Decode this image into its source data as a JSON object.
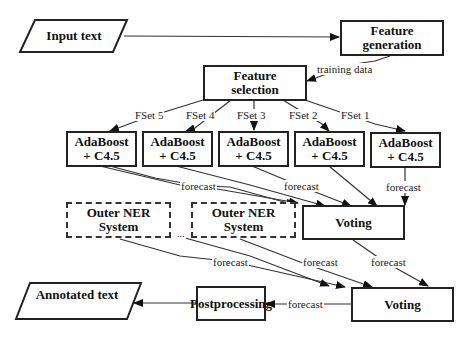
{
  "diagram": {
    "nodes": {
      "input_text": "Input text",
      "feature_generation": [
        "Feature",
        "generation"
      ],
      "feature_selection": [
        "Feature",
        "selection"
      ],
      "adaboost": [
        [
          "AdaBoost",
          "+ C4.5"
        ],
        [
          "AdaBoost",
          "+ C4.5"
        ],
        [
          "AdaBoost",
          "+ C4.5"
        ],
        [
          "AdaBoost",
          "+ C4.5"
        ],
        [
          "AdaBoost",
          "+ C4.5"
        ]
      ],
      "outer_ner": [
        [
          "Outer NER",
          "System"
        ],
        [
          "Outer NER",
          "System"
        ]
      ],
      "ellipsis": "...",
      "voting_1": "Voting",
      "voting_2": "Voting",
      "postprocessing": "Postprocessing",
      "annotated_text": "Annotated text"
    },
    "edge_labels": {
      "training_data": "training data",
      "fsets": [
        "FSet 5",
        "FSet 4",
        "FSet 3",
        "FSet 2",
        "FSet 1"
      ],
      "forecast_ada_left": "forecast",
      "forecast_ada_mid": "forecast",
      "forecast_ada_right": "forecast",
      "forecast_ner_left": "forecast",
      "forecast_ner_right": "forecast",
      "forecast_voting": "forecast",
      "forecast_post": "forecast"
    },
    "colors": {
      "stroke": "#222222",
      "background": "#ffffff"
    }
  }
}
